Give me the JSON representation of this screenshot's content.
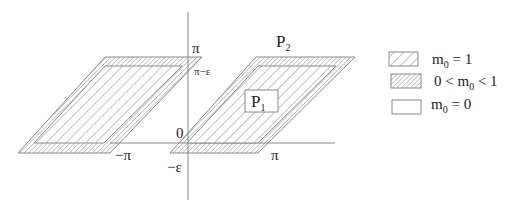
{
  "figure": {
    "axis_labels": {
      "pi_top": "π",
      "pi_minus_eps": "π−ε",
      "zero": "0",
      "neg_pi": "−π",
      "neg_eps": "−ε",
      "pi_right": "π"
    },
    "regions": {
      "p1": {
        "main": "P",
        "sub": "1"
      },
      "p2": {
        "main": "P",
        "sub": "2"
      }
    }
  },
  "legend": {
    "items": [
      {
        "pattern": "coarse-hatch",
        "label_pre": "m",
        "sub": "0",
        "label_post": " = 1"
      },
      {
        "pattern": "fine-hatch",
        "label_pre": "0 < m",
        "sub": "0",
        "label_post": " < 1"
      },
      {
        "pattern": "empty",
        "label_pre": "m",
        "sub": "0",
        "label_post": " = 0"
      }
    ]
  },
  "colors": {
    "line": "#8a8a8a",
    "hatch": "#7a7a7a",
    "text": "#222222"
  }
}
